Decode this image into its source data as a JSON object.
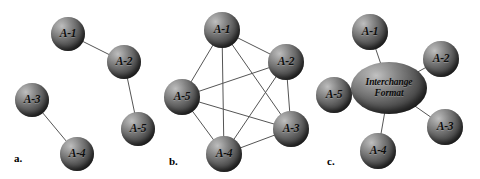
{
  "figure": {
    "background_color": "#ffffff",
    "node_fill_color": "#5c5c5c",
    "edge_color": "#555555",
    "label_color": "#0d0d0d",
    "width": 480,
    "height": 179
  },
  "panels": [
    {
      "id": "a",
      "caption": "a.",
      "caption_x": 14,
      "caption_y": 152,
      "topology": "point-to-point pairs",
      "nodes": [
        {
          "id": "a1",
          "label": "A-1",
          "cx": 68,
          "cy": 34,
          "r": 17
        },
        {
          "id": "a2",
          "label": "A-2",
          "cx": 124,
          "cy": 62,
          "r": 17
        },
        {
          "id": "a3",
          "label": "A-3",
          "cx": 32,
          "cy": 100,
          "r": 17
        },
        {
          "id": "a4",
          "label": "A-4",
          "cx": 77,
          "cy": 154,
          "r": 17
        },
        {
          "id": "a5",
          "label": "A-5",
          "cx": 138,
          "cy": 129,
          "r": 17
        }
      ],
      "edges": [
        {
          "from": "a1",
          "to": "a2"
        },
        {
          "from": "a2",
          "to": "a5"
        },
        {
          "from": "a3",
          "to": "a4"
        }
      ]
    },
    {
      "id": "b",
      "caption": "b.",
      "caption_x": 9,
      "caption_y": 155,
      "topology": "fully meshed",
      "nodes": [
        {
          "id": "b1",
          "label": "A-1",
          "cx": 62,
          "cy": 30,
          "r": 18
        },
        {
          "id": "b2",
          "label": "A-2",
          "cx": 126,
          "cy": 62,
          "r": 18
        },
        {
          "id": "b3",
          "label": "A-3",
          "cx": 131,
          "cy": 129,
          "r": 18
        },
        {
          "id": "b4",
          "label": "A-4",
          "cx": 64,
          "cy": 154,
          "r": 18
        },
        {
          "id": "b5",
          "label": "A-5",
          "cx": 22,
          "cy": 97,
          "r": 18
        }
      ],
      "edges": [
        {
          "from": "b1",
          "to": "b2"
        },
        {
          "from": "b1",
          "to": "b3"
        },
        {
          "from": "b1",
          "to": "b4"
        },
        {
          "from": "b1",
          "to": "b5"
        },
        {
          "from": "b2",
          "to": "b3"
        },
        {
          "from": "b2",
          "to": "b4"
        },
        {
          "from": "b2",
          "to": "b5"
        },
        {
          "from": "b3",
          "to": "b4"
        },
        {
          "from": "b3",
          "to": "b5"
        },
        {
          "from": "b4",
          "to": "b5"
        }
      ]
    },
    {
      "id": "c",
      "caption": "c.",
      "caption_x": 7,
      "caption_y": 155,
      "topology": "hub and spoke via interchange format",
      "hub": {
        "id": "chub",
        "label_line1": "Interchange",
        "label_line2": "Format",
        "cx": 69,
        "cy": 88,
        "rx": 38,
        "ry": 26
      },
      "nodes": [
        {
          "id": "c1",
          "label": "A-1",
          "cx": 50,
          "cy": 32,
          "r": 18
        },
        {
          "id": "c2",
          "label": "A-2",
          "cx": 121,
          "cy": 59,
          "r": 18
        },
        {
          "id": "c3",
          "label": "A-3",
          "cx": 125,
          "cy": 127,
          "r": 18
        },
        {
          "id": "c4",
          "label": "A-4",
          "cx": 58,
          "cy": 151,
          "r": 18
        },
        {
          "id": "c5",
          "label": "A-5",
          "cx": 14,
          "cy": 95,
          "r": 18
        }
      ],
      "edges": [
        {
          "from": "chub",
          "to": "c1"
        },
        {
          "from": "chub",
          "to": "c2"
        },
        {
          "from": "chub",
          "to": "c3"
        },
        {
          "from": "chub",
          "to": "c4"
        },
        {
          "from": "chub",
          "to": "c5"
        }
      ]
    }
  ]
}
